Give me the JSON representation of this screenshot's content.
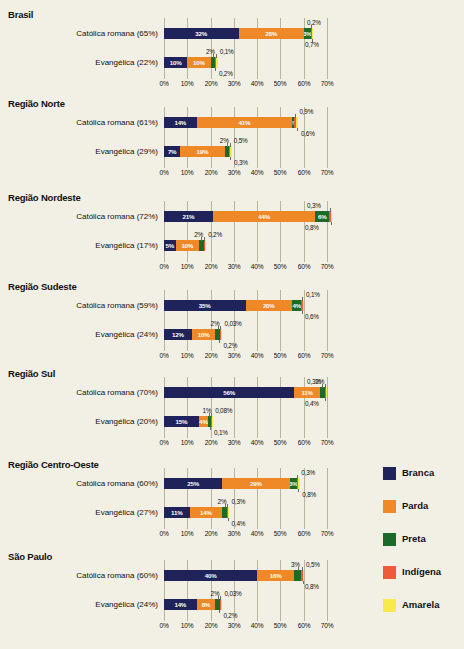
{
  "chart_data": {
    "type": "bar",
    "subtype": "stacked-horizontal",
    "title": "",
    "xlabel": "",
    "ylabel": "",
    "xlim": [
      0,
      70
    ],
    "xtick_labels": [
      "0%",
      "10%",
      "20%",
      "30%",
      "40%",
      "50%",
      "60%",
      "70%"
    ],
    "xticks": [
      0,
      10,
      20,
      30,
      40,
      50,
      60,
      70
    ],
    "grid": true,
    "legend_position": "right",
    "series": [
      {
        "name": "Branca",
        "color": "#1f2359"
      },
      {
        "name": "Parda",
        "color": "#ef8827"
      },
      {
        "name": "Preta",
        "color": "#1a6b2a"
      },
      {
        "name": "Indígena",
        "color": "#ee5a3a"
      },
      {
        "name": "Amarela",
        "color": "#f7ea4a"
      }
    ],
    "groups": [
      {
        "name": "Brasil",
        "bars": [
          {
            "label": "Católica romana (65%)",
            "values": [
              32,
              28,
              3,
              0.2,
              0.7
            ],
            "labels": [
              "32%",
              "28%",
              "3%",
              "0,2%",
              "0,7%"
            ],
            "inline": [
              true,
              true,
              true,
              false,
              false
            ]
          },
          {
            "label": "Evangélica (22%)",
            "values": [
              10,
              10,
              2,
              0.1,
              0.2
            ],
            "labels": [
              "10%",
              "10%",
              "2%",
              "0,1%",
              "0,2%"
            ],
            "inline": [
              true,
              true,
              false,
              false,
              false
            ]
          }
        ]
      },
      {
        "name": "Região Norte",
        "bars": [
          {
            "label": "Católica romana (61%)",
            "values": [
              14,
              41,
              1,
              0.9,
              0.6
            ],
            "labels": [
              "14%",
              "41%",
              "1%",
              "0,9%",
              "0,6%"
            ],
            "inline": [
              true,
              true,
              true,
              false,
              false
            ]
          },
          {
            "label": "Evangélica (29%)",
            "values": [
              7,
              19,
              2,
              0.5,
              0.3
            ],
            "labels": [
              "7%",
              "19%",
              "2%",
              "0,5%",
              "0,3%"
            ],
            "inline": [
              true,
              true,
              false,
              false,
              false
            ]
          }
        ]
      },
      {
        "name": "Região Nordeste",
        "bars": [
          {
            "label": "Católica romana (72%)",
            "values": [
              21,
              44,
              6,
              0.3,
              0.8
            ],
            "labels": [
              "21%",
              "44%",
              "6%",
              "0,3%",
              "0,8%"
            ],
            "inline": [
              true,
              true,
              true,
              false,
              false
            ]
          },
          {
            "label": "Evangélica (17%)",
            "values": [
              5,
              10,
              2,
              0.2,
              0.2
            ],
            "labels": [
              "5%",
              "10%",
              "2%",
              "0,2%",
              ""
            ],
            "inline": [
              true,
              true,
              false,
              false,
              false
            ]
          }
        ]
      },
      {
        "name": "Região Sudeste",
        "bars": [
          {
            "label": "Católica romana (59%)",
            "values": [
              35,
              20,
              4,
              0.1,
              0.6
            ],
            "labels": [
              "35%",
              "20%",
              "4%",
              "0,1%",
              "0,6%"
            ],
            "inline": [
              true,
              true,
              true,
              false,
              false
            ]
          },
          {
            "label": "Evangélica (24%)",
            "values": [
              12,
              10,
              2,
              0.03,
              0.2
            ],
            "labels": [
              "12%",
              "10%",
              "2%",
              "0,03%",
              "0,2%"
            ],
            "inline": [
              true,
              true,
              false,
              false,
              false
            ]
          }
        ]
      },
      {
        "name": "Região Sul",
        "bars": [
          {
            "label": "Católica romana (70%)",
            "values": [
              56,
              11,
              2,
              0.3,
              0.4
            ],
            "labels": [
              "56%",
              "11%",
              "2%",
              "0,3%",
              "0,4%"
            ],
            "inline": [
              true,
              true,
              false,
              false,
              false
            ]
          },
          {
            "label": "Evangélica (20%)",
            "values": [
              15,
              4,
              1,
              0.08,
              0.1
            ],
            "labels": [
              "15%",
              "4%",
              "1%",
              "0,08%",
              "0,1%"
            ],
            "inline": [
              true,
              true,
              false,
              false,
              false
            ]
          }
        ]
      },
      {
        "name": "Região Centro-Oeste",
        "bars": [
          {
            "label": "Católica romana (60%)",
            "values": [
              25,
              29,
              3,
              0.3,
              0.8
            ],
            "labels": [
              "25%",
              "29%",
              "3%",
              "0,3%",
              "0,8%"
            ],
            "inline": [
              true,
              true,
              true,
              false,
              false
            ]
          },
          {
            "label": "Evangélica (27%)",
            "values": [
              11,
              14,
              2,
              0.3,
              0.4
            ],
            "labels": [
              "11%",
              "14%",
              "2%",
              "0,3%",
              "0,4%"
            ],
            "inline": [
              true,
              true,
              false,
              false,
              false
            ]
          }
        ]
      },
      {
        "name": "São Paulo",
        "bars": [
          {
            "label": "Católica romana (60%)",
            "values": [
              40,
              16,
              3,
              0.5,
              0.8
            ],
            "labels": [
              "40%",
              "16%",
              "3%",
              "0,5%",
              "0,8%"
            ],
            "inline": [
              true,
              true,
              false,
              false,
              false
            ]
          },
          {
            "label": "Evangélica (24%)",
            "values": [
              14,
              8,
              2,
              0.03,
              0.2
            ],
            "labels": [
              "14%",
              "8%",
              "2%",
              "0,03%",
              "0,2%"
            ],
            "inline": [
              true,
              true,
              false,
              false,
              false
            ]
          }
        ]
      }
    ]
  },
  "legend": {
    "items": [
      {
        "label": "Branca",
        "color": "#1f2359"
      },
      {
        "label": "Parda",
        "color": "#ef8827"
      },
      {
        "label": "Preta",
        "color": "#1a6b2a"
      },
      {
        "label": "Indígena",
        "color": "#ee5a3a"
      },
      {
        "label": "Amarela",
        "color": "#f7ea4a"
      }
    ]
  }
}
